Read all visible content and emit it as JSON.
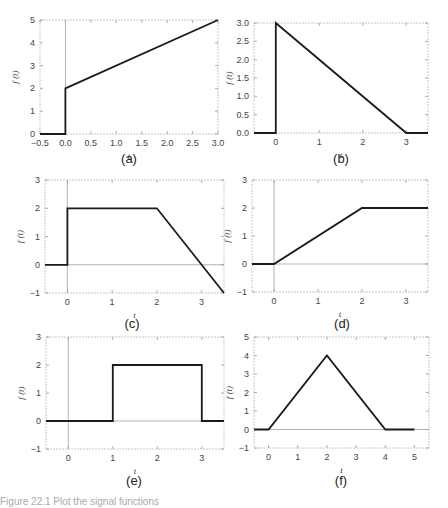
{
  "figure": {
    "caption": "Figure 22.1 Plot the signal functions",
    "style": {
      "line_color": "#1a1a1a",
      "frame_color": "#c8c8c8",
      "axis_color": "#b4b4b4"
    }
  },
  "chart_data": [
    {
      "id": "a",
      "label": "(a)",
      "type": "line",
      "xlabel": "t",
      "ylabel": "f (t)",
      "xlim": [
        -0.5,
        3.0
      ],
      "ylim": [
        0,
        5
      ],
      "xticks": [
        -0.5,
        0.0,
        0.5,
        1.0,
        1.5,
        2.0,
        2.5,
        3.0
      ],
      "xtick_labels": [
        "-0.5",
        "0.0",
        "0.5",
        "1.0",
        "1.5",
        "2.0",
        "2.5",
        "3.0"
      ],
      "yticks": [
        0,
        1,
        2,
        3,
        4,
        5
      ],
      "ytick_labels": [
        "0",
        "1",
        "2",
        "3",
        "4",
        "5"
      ],
      "vline_at_zero": true,
      "hline_at_zero": false,
      "x": [
        -0.5,
        0,
        0,
        3
      ],
      "y": [
        0,
        0,
        2,
        5
      ]
    },
    {
      "id": "b",
      "label": "(b)",
      "type": "line",
      "xlabel": "t",
      "ylabel": "f (t)",
      "xlim": [
        -0.5,
        3.5
      ],
      "ylim": [
        0,
        3
      ],
      "xticks": [
        0,
        1,
        2,
        3
      ],
      "xtick_labels": [
        "0",
        "1",
        "2",
        "3"
      ],
      "yticks": [
        0,
        0.5,
        1.0,
        1.5,
        2.0,
        2.5,
        3.0
      ],
      "ytick_labels": [
        "0.0",
        "0.5",
        "1.0",
        "1.5",
        "2.0",
        "2.5",
        "3.0"
      ],
      "vline_at_zero": false,
      "hline_at_zero": false,
      "x": [
        -0.5,
        0,
        0,
        3,
        3.5
      ],
      "y": [
        0,
        0,
        3,
        0,
        0
      ]
    },
    {
      "id": "c",
      "label": "(c)",
      "type": "line",
      "xlabel": "t",
      "ylabel": "f (t)",
      "xlim": [
        -0.5,
        3.5
      ],
      "ylim": [
        -1,
        3
      ],
      "xticks": [
        0,
        1,
        2,
        3
      ],
      "xtick_labels": [
        "0",
        "1",
        "2",
        "3"
      ],
      "yticks": [
        -1,
        0,
        1,
        2,
        3
      ],
      "ytick_labels": [
        "-1",
        "0",
        "1",
        "2",
        "3"
      ],
      "vline_at_zero": true,
      "hline_at_zero": true,
      "x": [
        -0.5,
        0,
        0,
        2,
        3.5
      ],
      "y": [
        0,
        0,
        2,
        2,
        -1
      ]
    },
    {
      "id": "d",
      "label": "(d)",
      "type": "line",
      "xlabel": "t",
      "ylabel": "f (t)",
      "xlim": [
        -0.5,
        3.5
      ],
      "ylim": [
        -1,
        3
      ],
      "xticks": [
        0,
        1,
        2,
        3
      ],
      "xtick_labels": [
        "0",
        "1",
        "2",
        "3"
      ],
      "yticks": [
        -1,
        0,
        1,
        2,
        3
      ],
      "ytick_labels": [
        "-1",
        "0",
        "1",
        "2",
        "3"
      ],
      "vline_at_zero": true,
      "hline_at_zero": true,
      "x": [
        -0.5,
        0,
        2,
        3.5
      ],
      "y": [
        0,
        0,
        2,
        2
      ]
    },
    {
      "id": "e",
      "label": "(e)",
      "type": "line",
      "xlabel": "t",
      "ylabel": "f (t)",
      "xlim": [
        -0.5,
        3.5
      ],
      "ylim": [
        -1,
        3
      ],
      "xticks": [
        0,
        1,
        2,
        3
      ],
      "xtick_labels": [
        "0",
        "1",
        "2",
        "3"
      ],
      "yticks": [
        -1,
        0,
        1,
        2,
        3
      ],
      "ytick_labels": [
        "-1",
        "0",
        "1",
        "2",
        "3"
      ],
      "vline_at_zero": true,
      "hline_at_zero": true,
      "x": [
        -0.5,
        1,
        1,
        3,
        3,
        3.5
      ],
      "y": [
        0,
        0,
        2,
        2,
        0,
        0
      ]
    },
    {
      "id": "f",
      "label": "(f)",
      "type": "line",
      "xlabel": "t",
      "ylabel": "f (t)",
      "xlim": [
        -0.5,
        5.5
      ],
      "ylim": [
        -1,
        5
      ],
      "xticks": [
        0,
        1,
        2,
        3,
        4,
        5
      ],
      "xtick_labels": [
        "0",
        "1",
        "2",
        "3",
        "4",
        "5"
      ],
      "yticks": [
        -1,
        0,
        1,
        2,
        3,
        4,
        5
      ],
      "ytick_labels": [
        "-1",
        "0",
        "1",
        "2",
        "3",
        "4",
        "5"
      ],
      "vline_at_zero": false,
      "hline_at_zero": true,
      "x": [
        -0.5,
        0,
        2,
        4,
        5
      ],
      "y": [
        0,
        0,
        4,
        0,
        0
      ]
    }
  ]
}
